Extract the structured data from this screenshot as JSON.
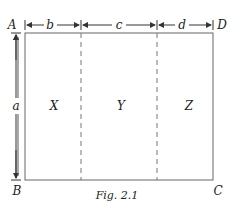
{
  "figure": {
    "caption": "Fig. 2.1",
    "corners": {
      "top_left": "A",
      "top_right": "D",
      "bottom_left": "B",
      "bottom_right": "C"
    },
    "dimensions": {
      "height": "a",
      "widths": [
        "b",
        "c",
        "d"
      ]
    },
    "regions": [
      "X",
      "Y",
      "Z"
    ],
    "colors": {
      "line": "#555555",
      "text": "#222222"
    }
  }
}
